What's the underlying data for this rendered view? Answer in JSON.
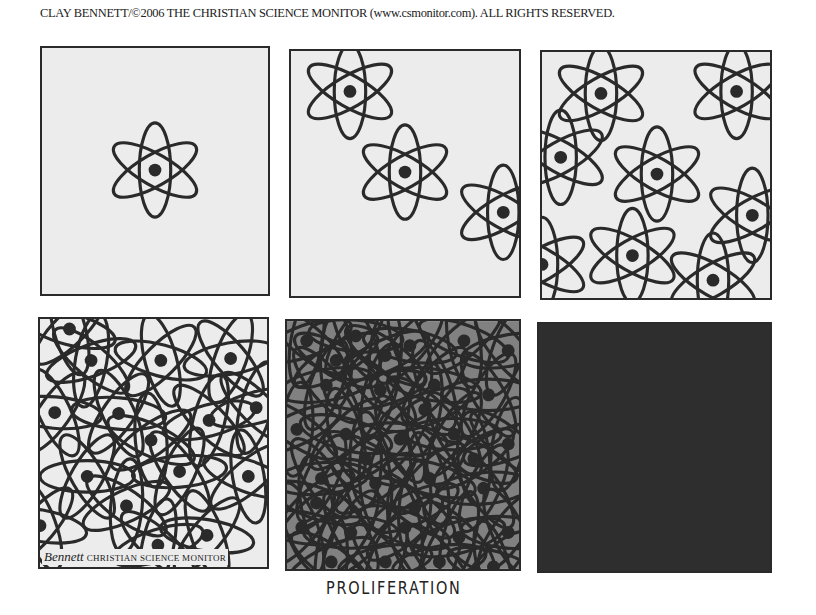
{
  "credit_line": "CLAY BENNETT/©2006 THE CHRISTIAN SCIENCE MONITOR (www.csmonitor.com). ALL RIGHTS RESERVED.",
  "caption": "PROLIFERATION",
  "signature": {
    "artist": "Bennett",
    "publication": "CHRISTIAN SCIENCE MONITOR"
  },
  "colors": {
    "ink": "#2a2a2a",
    "paper": "#ececec",
    "background": "#ffffff"
  },
  "panels": [
    {
      "index": 1,
      "description": "single atom symbol centered",
      "atom_count": 1
    },
    {
      "index": 2,
      "description": "three atom symbols on a diagonal",
      "atom_count": 3
    },
    {
      "index": 3,
      "description": "nine overlapping atom symbols",
      "atom_count": 9
    },
    {
      "index": 4,
      "description": "dense tangle of atom orbits with many nuclei",
      "atom_count": 14
    },
    {
      "index": 5,
      "description": "nearly black mass of overlapping orbits",
      "atom_count": 40
    },
    {
      "index": 6,
      "description": "solid black panel",
      "atom_count": 0
    }
  ]
}
